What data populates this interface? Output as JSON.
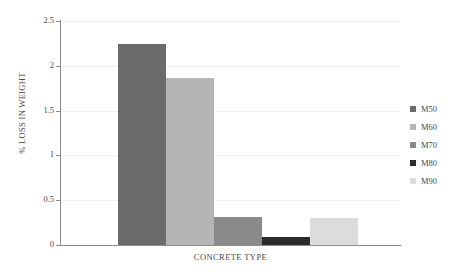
{
  "chart_data": {
    "type": "bar",
    "title": "",
    "xlabel": "CONCRETE TYPE",
    "ylabel": "% LOSS IN WEIGHT",
    "categories": [
      "M50",
      "M60",
      "M70",
      "M80",
      "M90"
    ],
    "values": [
      2.24,
      1.86,
      0.31,
      0.09,
      0.3
    ],
    "series": [
      {
        "name": "% LOSS IN WEIGHT",
        "values": [
          2.24,
          1.86,
          0.31,
          0.09,
          0.3
        ]
      }
    ],
    "ylim": [
      0,
      2.5
    ],
    "y_ticks": [
      "0",
      "0.5",
      "1",
      "1.5",
      "2",
      "2.5"
    ],
    "y_tick_values": [
      0,
      0.5,
      1,
      1.5,
      2,
      2.5
    ],
    "grid": "horizontal",
    "legend_position": "right",
    "bar_colors": [
      "#6b6b6b",
      "#b5b5b5",
      "#8a8a8a",
      "#2b2b2b",
      "#dcdcdc"
    ],
    "legend": [
      {
        "label": "M50",
        "color": "#6b6b6b"
      },
      {
        "label": "M60",
        "color": "#b5b5b5"
      },
      {
        "label": "M70",
        "color": "#8a8a8a"
      },
      {
        "label": "M80",
        "color": "#2b2b2b"
      },
      {
        "label": "M90",
        "color": "#dcdcdc"
      }
    ]
  }
}
